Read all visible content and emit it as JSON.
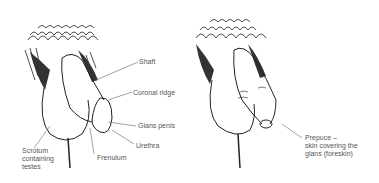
{
  "left": {
    "labels": {
      "shaft": "Shaft",
      "coronal_ridge": "Coronal ridge",
      "glans": "Glans penis",
      "urethra": "Urethra",
      "frenulum": "Frenulum",
      "scrotum": "Scrotum\ncontaining\ntestes"
    }
  },
  "right": {
    "labels": {
      "prepuce": "Prepuce –\nskin covering the\nglans (foreskin)"
    }
  }
}
